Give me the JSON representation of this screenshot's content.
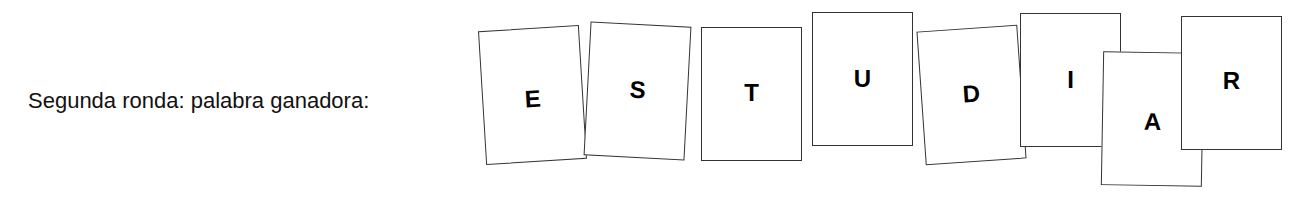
{
  "caption": "Segunda ronda: palabra ganadora:",
  "word": "ESTUDIAR",
  "cards": [
    {
      "letter": "E"
    },
    {
      "letter": "S"
    },
    {
      "letter": "T"
    },
    {
      "letter": "U"
    },
    {
      "letter": "D"
    },
    {
      "letter": "I"
    },
    {
      "letter": "A"
    },
    {
      "letter": "R"
    }
  ]
}
